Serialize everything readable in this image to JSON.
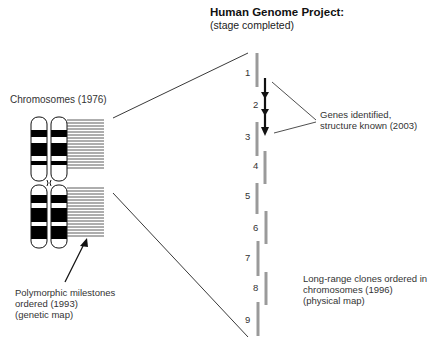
{
  "header": {
    "title": "Human Genome Project:",
    "subtitle": "(stage completed)"
  },
  "labels": {
    "chromosomes": "Chromosomes (1976)",
    "genetic_map": [
      "Polymorphic milestones",
      "ordered (1993)",
      "(genetic map)"
    ],
    "genes": [
      "Genes identified,",
      "structure known (2003)"
    ],
    "physical_map": [
      "Long-range clones ordered in",
      "chromosomes (1996)",
      "(physical map)"
    ]
  },
  "clones": [
    {
      "id": "1",
      "x": 257,
      "y1": 53,
      "y2": 87
    },
    {
      "id": "2",
      "x": 265,
      "y1": 78,
      "y2": 136
    },
    {
      "id": "3",
      "x": 257,
      "y1": 122,
      "y2": 156
    },
    {
      "id": "4",
      "x": 265,
      "y1": 151,
      "y2": 184
    },
    {
      "id": "5",
      "x": 257,
      "y1": 183,
      "y2": 214
    },
    {
      "id": "6",
      "x": 266,
      "y1": 211,
      "y2": 244
    },
    {
      "id": "7",
      "x": 258,
      "y1": 241,
      "y2": 276
    },
    {
      "id": "8",
      "x": 266,
      "y1": 272,
      "y2": 305
    },
    {
      "id": "9",
      "x": 258,
      "y1": 302,
      "y2": 336
    }
  ],
  "colors": {
    "clone": "#9a9a9a",
    "line": "#222222",
    "band": "#000000"
  }
}
